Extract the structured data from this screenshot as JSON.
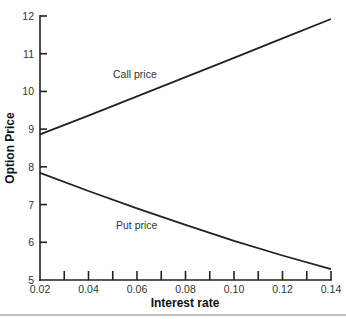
{
  "chart_data": {
    "type": "line",
    "title": "",
    "xlabel": "Interest rate",
    "ylabel": "Option Price",
    "xlim": [
      0.02,
      0.14
    ],
    "ylim": [
      5,
      12
    ],
    "x_ticks": [
      0.02,
      0.03,
      0.04,
      0.05,
      0.06,
      0.07,
      0.08,
      0.09,
      0.1,
      0.11,
      0.12,
      0.13,
      0.14
    ],
    "x_tick_labels": [
      "0.02",
      "0.04",
      "0.06",
      "0.08",
      "0.10",
      "0.12",
      "0.14"
    ],
    "y_ticks": [
      5,
      6,
      7,
      8,
      9,
      10,
      11,
      12
    ],
    "y_tick_labels": [
      "5",
      "6",
      "7",
      "8",
      "9",
      "10",
      "11",
      "12"
    ],
    "grid": false,
    "legend": "none (inline series labels)",
    "x": [
      0.02,
      0.04,
      0.06,
      0.08,
      0.1,
      0.12,
      0.14
    ],
    "series": [
      {
        "name": "Call price",
        "values": [
          8.86,
          9.36,
          9.87,
          10.38,
          10.89,
          11.41,
          11.92
        ]
      },
      {
        "name": "Put price",
        "values": [
          7.84,
          7.36,
          6.9,
          6.46,
          6.04,
          5.65,
          5.29
        ]
      }
    ],
    "annotations": [
      {
        "text": "Call price",
        "x": 0.05,
        "y": 10.4
      },
      {
        "text": "Put price",
        "x": 0.05,
        "y": 6.4
      }
    ]
  },
  "labels": {
    "x_axis_title": "Interest rate",
    "y_axis_title": "Option Price",
    "call_label": "Call price",
    "put_label": "Put price"
  }
}
